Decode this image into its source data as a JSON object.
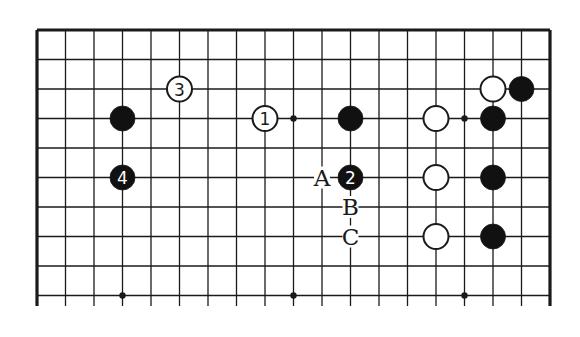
{
  "diagram": {
    "type": "go-board-partial",
    "grid": {
      "x0": 37,
      "y0": 30,
      "dx": 28.5,
      "dy": 29.5,
      "cols": 19,
      "rows_visible": 10,
      "bottom_cut_y": 306,
      "top_edge": true,
      "left_edge": true,
      "right_edge": true
    },
    "star_points": [
      {
        "col": 3,
        "row": 3
      },
      {
        "col": 9,
        "row": 3
      },
      {
        "col": 15,
        "row": 3
      },
      {
        "col": 3,
        "row": 9
      },
      {
        "col": 9,
        "row": 9
      },
      {
        "col": 15,
        "row": 9
      }
    ],
    "stones": [
      {
        "color": "black",
        "col": 3,
        "row": 3,
        "label": ""
      },
      {
        "color": "black",
        "col": 3,
        "row": 5,
        "label": "4"
      },
      {
        "color": "white",
        "col": 5,
        "row": 2,
        "label": "3"
      },
      {
        "color": "white",
        "col": 8,
        "row": 3,
        "label": "1"
      },
      {
        "color": "black",
        "col": 11,
        "row": 3,
        "label": ""
      },
      {
        "color": "black",
        "col": 11,
        "row": 5,
        "label": "2"
      },
      {
        "color": "white",
        "col": 14,
        "row": 3,
        "label": ""
      },
      {
        "color": "white",
        "col": 14,
        "row": 5,
        "label": ""
      },
      {
        "color": "white",
        "col": 14,
        "row": 7,
        "label": ""
      },
      {
        "color": "white",
        "col": 16,
        "row": 2,
        "label": ""
      },
      {
        "color": "black",
        "col": 16,
        "row": 3,
        "label": ""
      },
      {
        "color": "black",
        "col": 16,
        "row": 5,
        "label": ""
      },
      {
        "color": "black",
        "col": 16,
        "row": 7,
        "label": ""
      },
      {
        "color": "black",
        "col": 17,
        "row": 2,
        "label": ""
      }
    ],
    "letter_marks": [
      {
        "letter": "A",
        "col": 10,
        "row": 5
      },
      {
        "letter": "B",
        "col": 11,
        "row": 6
      },
      {
        "letter": "C",
        "col": 11,
        "row": 7
      }
    ],
    "colors": {
      "line": "#1a1a1a",
      "black_stone": "#111111",
      "white_stone": "#ffffff",
      "background": "#ffffff"
    }
  }
}
